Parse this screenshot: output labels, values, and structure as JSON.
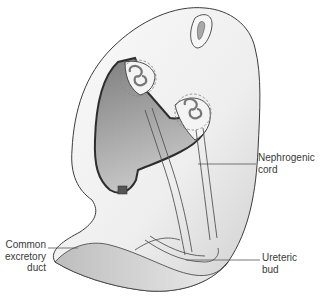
{
  "figure": {
    "labels": {
      "nephrogenic_cord": [
        "Nephrogenic",
        "cord"
      ],
      "common_excretory_duct": [
        "Common",
        "excretory",
        "duct"
      ],
      "ureteric_bud": [
        "Ureteric",
        "bud"
      ]
    },
    "colors": {
      "outline": "#3c3c3c",
      "cavity_dark": "#8a8a8a",
      "cavity_light": "#cfcfcf",
      "body_fill": "#f2f2f2",
      "dashed": "#888888"
    }
  }
}
